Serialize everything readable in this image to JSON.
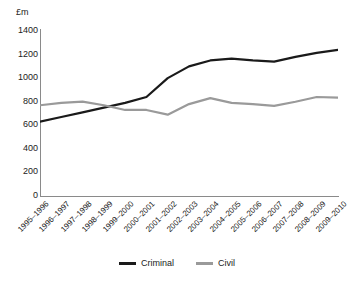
{
  "chart_data": {
    "type": "line",
    "title": "",
    "subtitle": "",
    "xlabel": "",
    "ylabel": "£m",
    "ylim": [
      0,
      1400
    ],
    "yticks": [
      0,
      200,
      400,
      600,
      800,
      1000,
      1200,
      1400
    ],
    "grid": false,
    "legend_position": "bottom",
    "categories": [
      "1995–1996",
      "1996–1997",
      "1997–1998",
      "1998–1999",
      "1999–2000",
      "2000–2001",
      "2001–2002",
      "2002–2003",
      "2003–2004",
      "2004–2005",
      "2005–2006",
      "2006–2007",
      "2007–2008",
      "2008–2009",
      "2009–2010"
    ],
    "series": [
      {
        "name": "Criminal",
        "color": "#1a1a1a",
        "values": [
          630,
          670,
          710,
          750,
          790,
          840,
          1000,
          1100,
          1150,
          1165,
          1150,
          1140,
          1180,
          1215,
          1240
        ]
      },
      {
        "name": "Civil",
        "color": "#9a9a9a",
        "values": [
          770,
          790,
          800,
          770,
          730,
          730,
          690,
          780,
          830,
          790,
          780,
          765,
          800,
          840,
          835
        ]
      }
    ]
  },
  "axis": {
    "unit_label": "£m"
  },
  "legend": {
    "items": [
      {
        "label": "Criminal",
        "color": "#1a1a1a"
      },
      {
        "label": "Civil",
        "color": "#9a9a9a"
      }
    ]
  },
  "colors": {
    "criminal": "#1a1a1a",
    "civil": "#9a9a9a",
    "axis": "#8a8a8a",
    "text": "#222222",
    "background": "#ffffff"
  }
}
